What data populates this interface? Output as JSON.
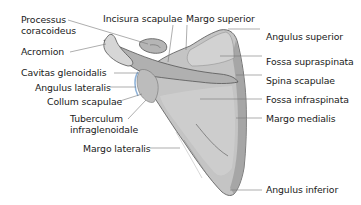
{
  "diagram": {
    "colors": {
      "bone_fill": "#c4c4c4",
      "bone_light": "#d8d8d8",
      "bone_shadow": "#9a9a9a",
      "outline": "#555555",
      "leader_line": "#777777",
      "glenoid_highlight": "#8fb3d9",
      "text": "#1a1a1a"
    },
    "labels_left": [
      {
        "id": "processus-coracoideus",
        "line1": "Processus",
        "line2": "coracoideus"
      },
      {
        "id": "acromion",
        "text": "Acromion"
      },
      {
        "id": "cavitas-glenoidalis",
        "text": "Cavitas glenoidalis"
      },
      {
        "id": "angulus-lateralis",
        "text": "Angulus lateralis"
      },
      {
        "id": "collum-scapulae",
        "text": "Collum scapulae"
      },
      {
        "id": "tuberculum-infraglenoidale",
        "line1": "Tuberculum",
        "line2": "infraglenoidale"
      },
      {
        "id": "margo-lateralis",
        "text": "Margo lateralis"
      }
    ],
    "labels_top": [
      {
        "id": "incisura-scapulae",
        "text": "Incisura scapulae"
      },
      {
        "id": "margo-superior",
        "text": "Margo superior"
      }
    ],
    "labels_right": [
      {
        "id": "angulus-superior",
        "text": "Angulus superior"
      },
      {
        "id": "fossa-supraspinata",
        "text": "Fossa supraspinata"
      },
      {
        "id": "spina-scapulae",
        "text": "Spina scapulae"
      },
      {
        "id": "fossa-infraspinata",
        "text": "Fossa infraspinata"
      },
      {
        "id": "margo-medialis",
        "text": "Margo medialis"
      },
      {
        "id": "angulus-inferior",
        "text": "Angulus inferior"
      }
    ]
  }
}
